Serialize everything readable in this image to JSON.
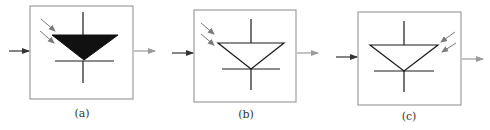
{
  "figure": {
    "panels": [
      {
        "id": "a",
        "label": "(a)",
        "description": "Filled triangle diode symbol with incident light arrows on upper-left"
      },
      {
        "id": "b",
        "label": "(b)",
        "description": "Outlined triangle diode symbol with incident light arrows on upper-left"
      },
      {
        "id": "c",
        "label": "(c)",
        "description": "Outlined triangle diode symbol with incident light arrows on upper-right"
      }
    ]
  },
  "colors": {
    "box_stroke": "#8a8a8a",
    "symbol_stroke": "#1a1a1a",
    "symbol_fill": "#111111",
    "input_arrow": "#333333",
    "output_arrow": "#9a9a9a",
    "light_arrow": "#7a7a7a"
  }
}
